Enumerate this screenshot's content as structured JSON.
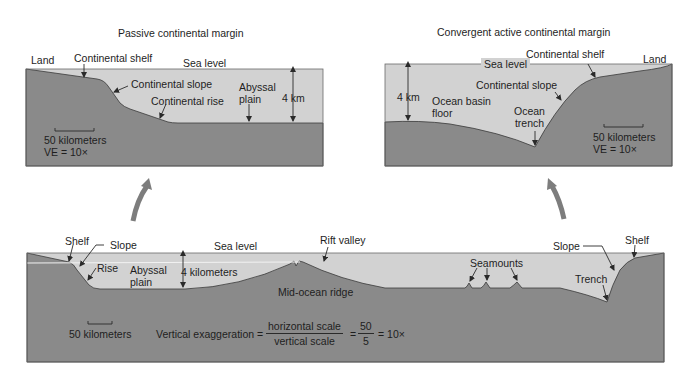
{
  "colors": {
    "water": "#d2d2d2",
    "crust": "#8a8a8a",
    "outline": "#3a3a3a",
    "arrow": "#7d7d7d",
    "text": "#1e1e1e"
  },
  "passive_margin": {
    "title": "Passive continental margin",
    "labels": {
      "land": "Land",
      "continental_shelf": "Continental shelf",
      "sea_level": "Sea level",
      "continental_slope": "Continental slope",
      "continental_rise": "Continental rise",
      "abyssal_plain_1": "Abyssal",
      "abyssal_plain_2": "plain",
      "depth": "4 km",
      "scale": "50 kilometers",
      "ve": "VE = 10×"
    }
  },
  "active_margin": {
    "title": "Convergent active continental margin",
    "labels": {
      "continental_shelf": "Continental shelf",
      "land": "Land",
      "sea_level": "Sea level",
      "continental_slope": "Continental slope",
      "depth": "4 km",
      "ocean_basin_1": "Ocean basin",
      "ocean_basin_2": "floor",
      "ocean_trench_1": "Ocean",
      "ocean_trench_2": "trench",
      "scale": "50 kilometers",
      "ve": "VE = 10×"
    }
  },
  "ocean_profile": {
    "labels": {
      "shelf_left": "Shelf",
      "slope_left": "Slope",
      "sea_level": "Sea level",
      "rift_valley": "Rift valley",
      "rise": "Rise",
      "abyssal_1": "Abyssal",
      "abyssal_2": "plain",
      "depth": "4 kilometers",
      "mid_ocean_ridge": "Mid-ocean ridge",
      "seamounts": "Seamounts",
      "slope_right": "Slope",
      "shelf_right": "Shelf",
      "trench": "Trench",
      "scale": "50 kilometers"
    },
    "formula": {
      "lhs": "Vertical exaggeration =",
      "numerator": "horizontal scale",
      "denominator": "vertical scale",
      "eq1": "=",
      "num2": "50",
      "den2": "5",
      "result": "= 10×"
    }
  }
}
